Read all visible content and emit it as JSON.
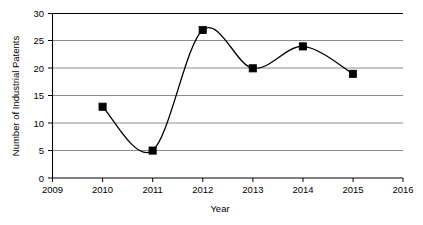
{
  "chart_data": {
    "type": "line",
    "title": "",
    "xlabel": "Year",
    "ylabel": "Number of Industrial Patents",
    "x": [
      2010,
      2011,
      2012,
      2013,
      2014,
      2015
    ],
    "values": [
      13,
      5,
      27,
      20,
      24,
      19
    ],
    "series": [
      {
        "name": "Number of Industrial Patents",
        "values": [
          13,
          5,
          27,
          20,
          24,
          19
        ]
      }
    ],
    "xlim": [
      2009,
      2016
    ],
    "ylim": [
      0,
      30
    ],
    "xticks": [
      2009,
      2010,
      2011,
      2012,
      2013,
      2014,
      2015,
      2016
    ],
    "xtick_labels": [
      "2009",
      "2010",
      "2011",
      "2012",
      "2013",
      "2014",
      "2015",
      "2016"
    ],
    "yticks": [
      0,
      5,
      10,
      15,
      20,
      25,
      30
    ],
    "ytick_labels": [
      "0",
      "5",
      "10",
      "15",
      "20",
      "25",
      "30"
    ],
    "grid": "horizontal",
    "legend": "none",
    "line_style": "smooth-spline",
    "marker": "filled-square",
    "line_color": "#000000",
    "marker_color": "#000000",
    "grid_color": "#8c8c8c",
    "axis_color": "#000000",
    "background_color": "#ffffff",
    "annotations": []
  }
}
